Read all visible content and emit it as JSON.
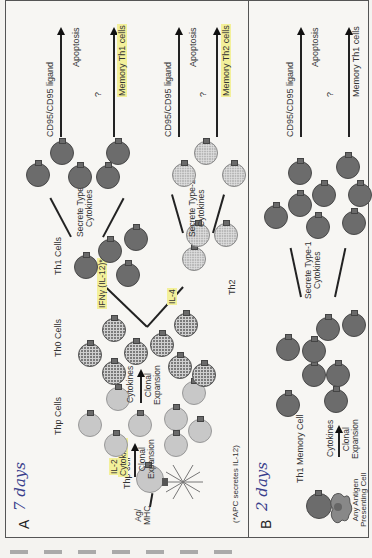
{
  "figure": {
    "orientation": "rotated-90-ccw",
    "panel_a": {
      "letter": "A",
      "handwritten_note": "7 days",
      "labels": {
        "thp_cell": "Thp cell",
        "ag_mhc": "Ag/\nMHC",
        "il2": "IL-2",
        "cytokines_1": "Cytokines",
        "clonal_expansion_1": "Clonal\nExpansion",
        "thp_cells": "Thp Cells",
        "cytokines_2": "Cytokines",
        "clonal_expansion_2": "Clonal\nExpansion",
        "th0_cells": "Th0 Cells",
        "ifn_gamma": "IFNγ (IL-12)*",
        "il4": "IL-4",
        "th1_cells": "Th1 Cells",
        "th2": "Th2",
        "secrete_type1": "Secrete Type-1\nCytokines",
        "secrete_type2": "Secrete Type-2\nCytokines",
        "cd95_ligand_1": "CD95/CD95 ligand",
        "cd95_ligand_2": "CD95/CD95 ligand",
        "question_1": "?",
        "question_2": "?",
        "apoptosis_1": "Apoptosis",
        "apoptosis_2": "Apoptosis",
        "memory_th1": "Memory Th1 cells",
        "memory_th2": "Memory Th2 cells",
        "footnote": "(*APC secretes IL-12)"
      }
    },
    "panel_b": {
      "letter": "B",
      "handwritten_note": "2 days",
      "labels": {
        "th1_memory_cell": "Th1 Memory Cell",
        "apc": "Any Antigen\nPresenting Cell",
        "cytokines": "Cytokines",
        "clonal_expansion": "Clonal\nExpansion",
        "secrete_type1": "Secrete Type-1\nCytokines",
        "cd95_ligand": "CD95/CD95 ligand",
        "question": "?",
        "apoptosis": "Apoptosis",
        "memory_th1": "Memory Th1 cells"
      }
    },
    "colors": {
      "thp": "#c8c8c8",
      "th0": "#7b7b7b",
      "th1": "#6c6c6c",
      "th2": "#b4b4b4",
      "highlight": "#f3f09a",
      "handwriting": "#3a3f8c"
    }
  }
}
